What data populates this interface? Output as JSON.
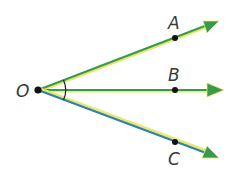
{
  "diagram": {
    "title": "",
    "vertex": {
      "label": "O",
      "x": 38,
      "y": 90
    },
    "rays": [
      {
        "name": "OA",
        "point_label": "A",
        "point": [
          175,
          38
        ],
        "end": [
          218,
          21
        ],
        "label_pos": [
          169,
          27
        ],
        "color": "#3a9a4a",
        "highlight": "#e6e870"
      },
      {
        "name": "OB",
        "point_label": "B",
        "point": [
          175,
          90
        ],
        "end": [
          223,
          90
        ],
        "label_pos": [
          169,
          80
        ],
        "color": "#3a9a4a",
        "highlight": "#e6e870"
      },
      {
        "name": "OC",
        "point_label": "C",
        "point": [
          175,
          142
        ],
        "end": [
          218,
          158
        ],
        "label_pos": [
          169,
          166
        ],
        "color": "#2f7fb5",
        "highlight": "#e6e870"
      }
    ],
    "angle_mark": {
      "between": [
        "OA",
        "OC"
      ],
      "radius": 27
    }
  }
}
